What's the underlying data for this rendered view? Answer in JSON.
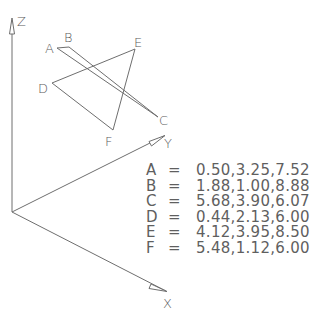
{
  "axes": {
    "x_label": "X",
    "y_label": "Y",
    "z_label": "Z"
  },
  "points": [
    {
      "name": "A",
      "coords": "0.50,3.25,7.52"
    },
    {
      "name": "B",
      "coords": "1.88,1.00,8.88"
    },
    {
      "name": "C",
      "coords": "5.68,3.90,6.07"
    },
    {
      "name": "D",
      "coords": "0.44,2.13,6.00"
    },
    {
      "name": "E",
      "coords": "4.12,3.95,8.50"
    },
    {
      "name": "F",
      "coords": "5.48,1.12,6.00"
    }
  ],
  "equals_sign": "=",
  "geometry": {
    "segments": [
      {
        "from": "A",
        "to": "C"
      },
      {
        "from": "B",
        "to": "C"
      }
    ],
    "triangle": [
      "D",
      "E",
      "F"
    ]
  },
  "colors": {
    "line": "#6e6e6e",
    "text": "#5f5f5f",
    "background": "#ffffff"
  }
}
